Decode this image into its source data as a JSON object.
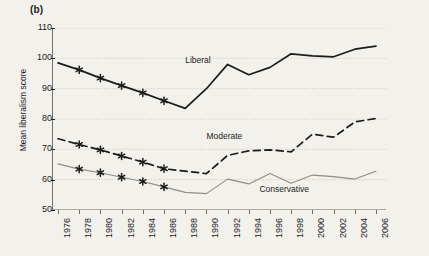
{
  "panel": {
    "label": "(b)"
  },
  "chart_data": {
    "type": "line",
    "title": "",
    "xlabel": "",
    "ylabel": "Mean liberalism score",
    "xlim": [
      1976,
      2006
    ],
    "ylim": [
      50,
      110
    ],
    "yticks": [
      50,
      60,
      70,
      80,
      90,
      100,
      110
    ],
    "grid": true,
    "legend_position": "inline-annotations",
    "categories": [
      1976,
      1978,
      1980,
      1982,
      1984,
      1986,
      1988,
      1990,
      1992,
      1994,
      1996,
      1998,
      2000,
      2002,
      2004,
      2006
    ],
    "xtick_labels": [
      "1976",
      "1978",
      "1980",
      "1982",
      "1984",
      "1986",
      "1988",
      "1990",
      "1992",
      "1994",
      "1996",
      "1998",
      "2000",
      "2002",
      "2004",
      "2006"
    ],
    "series": [
      {
        "name": "Liberal",
        "style": "solid",
        "color": "#1c1c1c",
        "markers": "asterisk",
        "marker_years": [
          1978,
          1980,
          1982,
          1984,
          1986
        ],
        "values": [
          98.5,
          96.2,
          93.5,
          91.0,
          88.6,
          86.0,
          83.5,
          90.0,
          98.0,
          94.6,
          97.0,
          101.5,
          100.8,
          100.5,
          103.0,
          104.0
        ]
      },
      {
        "name": "Moderate",
        "style": "dashed",
        "color": "#1c1c1c",
        "markers": "asterisk",
        "marker_years": [
          1978,
          1980,
          1982,
          1984,
          1986
        ],
        "values": [
          73.5,
          71.6,
          69.8,
          67.8,
          65.8,
          63.6,
          62.8,
          62.0,
          68.0,
          69.5,
          69.8,
          69.2,
          75.0,
          74.0,
          79.0,
          80.2
        ]
      },
      {
        "name": "Conservative",
        "style": "solid-light",
        "color": "#8f8d88",
        "markers": "asterisk",
        "marker_years": [
          1978,
          1980,
          1982,
          1984,
          1986
        ],
        "values": [
          65.2,
          63.5,
          62.3,
          60.8,
          59.4,
          57.6,
          55.8,
          55.4,
          60.2,
          58.6,
          62.0,
          58.8,
          61.5,
          61.0,
          60.2,
          62.8
        ]
      }
    ],
    "annotations": [
      {
        "text": "Liberal",
        "year": 1988,
        "value": 99.0
      },
      {
        "text": "Moderate",
        "year": 1990,
        "value": 74.0
      },
      {
        "text": "Conservative",
        "year": 1995,
        "value": 56.5
      }
    ]
  }
}
